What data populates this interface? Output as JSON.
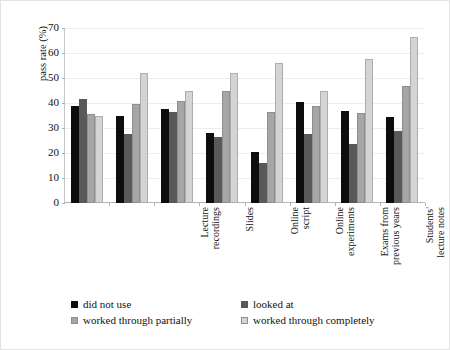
{
  "chart_data": {
    "type": "bar",
    "title": "",
    "xlabel": "",
    "ylabel": "pass rate (%)",
    "ylim": [
      0,
      70
    ],
    "yticks": [
      0,
      10,
      20,
      30,
      40,
      50,
      60,
      70
    ],
    "grid": true,
    "legend_position": "bottom",
    "categories": [
      "Lecture\nrecordings",
      "Slides",
      "Online\nscript",
      "Online\nexperiments",
      "Exams from\nprevious years",
      "Students'\nlecture notes",
      "STEM\ncourse",
      "Learning\ngroups"
    ],
    "series": [
      {
        "name": "did not use",
        "color": "#0d0d0d",
        "values": [
          39.0,
          35.0,
          37.5,
          28.0,
          20.5,
          40.5,
          37.0,
          34.5
        ]
      },
      {
        "name": "looked at",
        "color": "#595959",
        "values": [
          41.5,
          27.5,
          36.5,
          26.5,
          16.0,
          27.5,
          23.5,
          29.0
        ]
      },
      {
        "name": "worked through partially",
        "color": "#a6a6a6",
        "values": [
          35.5,
          39.5,
          41.0,
          45.0,
          36.5,
          39.0,
          36.0,
          47.0
        ]
      },
      {
        "name": "worked through completely",
        "color": "#d4d4d4",
        "values": [
          35.0,
          52.0,
          45.0,
          52.0,
          56.0,
          45.0,
          57.5,
          66.5
        ]
      }
    ]
  }
}
